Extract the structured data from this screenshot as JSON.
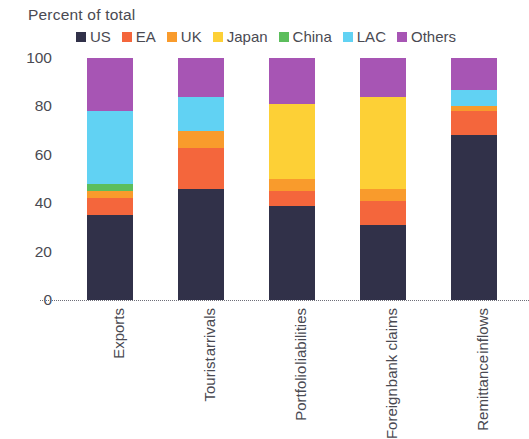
{
  "chart_data": {
    "type": "bar",
    "subtype": "stacked-100-percent",
    "title": "Percent of total",
    "xlabel": "",
    "ylabel": "",
    "ylim": [
      0,
      100
    ],
    "yticks": [
      0,
      20,
      40,
      60,
      80,
      100
    ],
    "ytick_labels": [
      "0",
      "20",
      "40",
      "60",
      "80",
      "100"
    ],
    "grid": false,
    "legend_position": "top",
    "categories": [
      "Exports",
      "Tourist arrivals",
      "Portfolio liabilities",
      "Foreign bank claims",
      "Remittance inflows"
    ],
    "category_lines": [
      [
        "Exports"
      ],
      [
        "Tourist",
        "arrivals"
      ],
      [
        "Portfolio",
        "liabilities"
      ],
      [
        "Foreign",
        "bank claims"
      ],
      [
        "Remittance",
        "inflows"
      ]
    ],
    "series": [
      {
        "name": "US",
        "color": "#313149",
        "values": [
          35,
          46,
          39,
          31,
          68
        ]
      },
      {
        "name": "EA",
        "color": "#f4663c",
        "values": [
          7,
          17,
          6,
          10,
          10
        ]
      },
      {
        "name": "UK",
        "color": "#f99b2c",
        "values": [
          3,
          7,
          5,
          5,
          2
        ]
      },
      {
        "name": "Japan",
        "color": "#fdd036",
        "values": [
          0,
          0,
          31,
          38,
          0
        ]
      },
      {
        "name": "China",
        "color": "#5cbe5c",
        "values": [
          3,
          0,
          0,
          0,
          0
        ]
      },
      {
        "name": "LAC",
        "color": "#61d2f3",
        "values": [
          30,
          14,
          0,
          0,
          7
        ]
      },
      {
        "name": "Others",
        "color": "#a755b4",
        "values": [
          22,
          16,
          19,
          16,
          13
        ]
      }
    ]
  }
}
